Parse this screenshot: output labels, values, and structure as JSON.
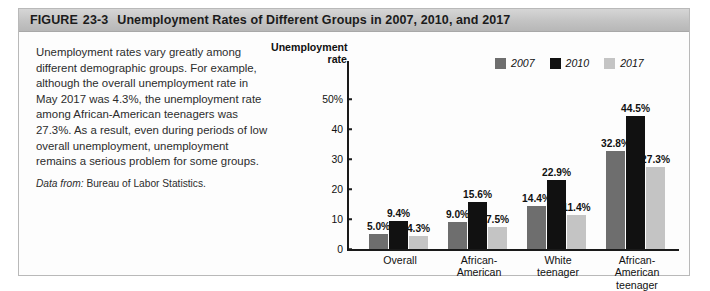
{
  "figure": {
    "header": {
      "figure_word": "FIGURE",
      "figure_number": "23-3",
      "title": "Unemployment Rates of Different Groups in 2007, 2010, and 2017"
    },
    "caption": {
      "body": "Unemployment rates vary greatly among different demographic groups. For example, although the overall unemployment rate in May 2017 was 4.3%, the unemployment rate among African-American teenagers was 27.3%. As a result, even during periods of low overall unemployment, unemployment remains a serious problem for some groups.",
      "source_lead": "Data from:",
      "source_text": "Bureau of Labor Statistics."
    }
  },
  "chart_data": {
    "type": "bar",
    "title": "Unemployment Rates of Different Groups in 2007, 2010, and 2017",
    "xlabel": "",
    "ylabel": "Unemployment rate",
    "ylabel_line1": "Unemployment",
    "ylabel_line2": "rate",
    "ylim": [
      0,
      50
    ],
    "yticks": [
      0,
      10,
      20,
      30,
      40,
      50
    ],
    "ytick_labels": [
      "0",
      "10",
      "20",
      "30",
      "40",
      "50%"
    ],
    "grid": false,
    "legend_position": "top-right",
    "categories": [
      "Overall",
      "African-American",
      "White teenager",
      "African-American teenager"
    ],
    "category_label_lines": [
      [
        "Overall"
      ],
      [
        "African-",
        "American"
      ],
      [
        "White",
        "teenager"
      ],
      [
        "African-",
        "American",
        "teenager"
      ]
    ],
    "series": [
      {
        "name": "2007",
        "color": "#6e6e6e",
        "values": [
          5.0,
          9.0,
          14.4,
          32.8
        ],
        "labels": [
          "5.0%",
          "9.0%",
          "14.4%",
          "32.8%"
        ]
      },
      {
        "name": "2010",
        "color": "#111111",
        "values": [
          9.4,
          15.6,
          22.9,
          44.5
        ],
        "labels": [
          "9.4%",
          "15.6%",
          "22.9%",
          "44.5%"
        ]
      },
      {
        "name": "2017",
        "color": "#c4c4c4",
        "values": [
          4.3,
          7.5,
          11.4,
          27.3
        ],
        "labels": [
          "4.3%",
          "7.5%",
          "11.4%",
          "27.3%"
        ]
      }
    ]
  }
}
